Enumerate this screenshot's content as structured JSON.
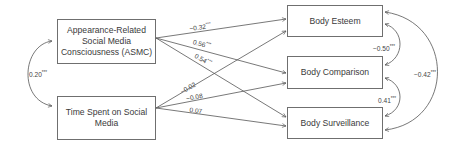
{
  "diagram": {
    "type": "path-model",
    "predictors": [
      {
        "id": "asmc",
        "label": "Appearance-Related Social Media Consciousness (ASMC)",
        "lines": [
          "Appearance-Related",
          "Social Media",
          "Consciousness (ASMC)"
        ]
      },
      {
        "id": "time",
        "label": "Time Spent on Social Media",
        "lines": [
          "Time Spent on Social",
          "Media"
        ]
      }
    ],
    "outcomes": [
      {
        "id": "esteem",
        "label": "Body Esteem"
      },
      {
        "id": "comparison",
        "label": "Body Comparison"
      },
      {
        "id": "surveillance",
        "label": "Body Surveillance"
      }
    ],
    "paths": [
      {
        "from": "asmc",
        "to": "esteem",
        "coef": "−0.32",
        "sig": "***"
      },
      {
        "from": "asmc",
        "to": "comparison",
        "coef": "0.56",
        "sig": "***"
      },
      {
        "from": "asmc",
        "to": "surveillance",
        "coef": "0.54",
        "sig": "***"
      },
      {
        "from": "time",
        "to": "esteem",
        "coef": "−0.02",
        "sig": ""
      },
      {
        "from": "time",
        "to": "comparison",
        "coef": "−0.08",
        "sig": ""
      },
      {
        "from": "time",
        "to": "surveillance",
        "coef": "0.07",
        "sig": ""
      }
    ],
    "covariances": [
      {
        "between": [
          "asmc",
          "time"
        ],
        "coef": "0.20",
        "sig": "***"
      },
      {
        "between": [
          "esteem",
          "comparison"
        ],
        "coef": "−0.50",
        "sig": "***"
      },
      {
        "between": [
          "comparison",
          "surveillance"
        ],
        "coef": "0.41",
        "sig": "***"
      },
      {
        "between": [
          "esteem",
          "surveillance"
        ],
        "coef": "−0.42",
        "sig": "***"
      }
    ]
  },
  "colors": {
    "line": "#555555",
    "box_border": "#6f6f6f",
    "text": "#3a3a3a"
  }
}
